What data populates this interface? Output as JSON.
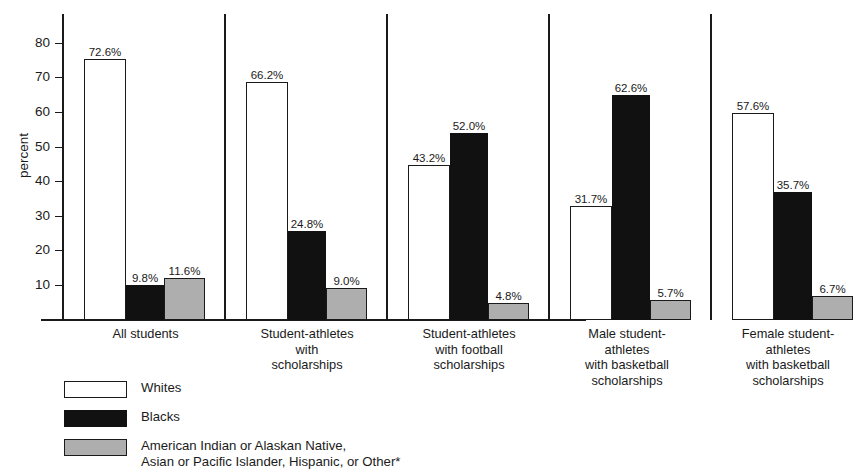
{
  "chart_data": {
    "type": "bar",
    "title": "",
    "subtitle": "",
    "xlabel": "",
    "ylabel": "percent",
    "ylim": [
      0,
      85
    ],
    "yticks": [
      10,
      20,
      30,
      40,
      50,
      60,
      70,
      80
    ],
    "grid": false,
    "legend_position": "bottom-left",
    "categories": [
      "All students",
      "Student-athletes\nwith\nscholarships",
      "Student-athletes\nwith football\nscholarships",
      "Male student-\nathletes\nwith basketball\nscholarships",
      "Female student-\nathletes\nwith basketball\nscholarships"
    ],
    "series": [
      {
        "name": "Whites",
        "color": "#ffffff",
        "values": [
          72.6,
          66.2,
          43.2,
          31.7,
          57.6
        ],
        "labels": [
          "72.6%",
          "66.2%",
          "43.2%",
          "31.7%",
          "57.6%"
        ]
      },
      {
        "name": "Blacks",
        "color": "#111111",
        "values": [
          9.8,
          24.8,
          52.0,
          62.6,
          35.7
        ],
        "labels": [
          "9.8%",
          "24.8%",
          "52.0%",
          "62.6%",
          "35.7%"
        ]
      },
      {
        "name": "American Indian or Alaskan Native,\nAsian or Pacific Islander, Hispanic, or Other*",
        "color": "#aeaeae",
        "values": [
          11.6,
          9.0,
          4.8,
          5.7,
          6.7
        ],
        "labels": [
          "11.6%",
          "9.0%",
          "4.8%",
          "5.7%",
          "6.7%"
        ]
      }
    ]
  },
  "axis": {
    "ylabel": "percent",
    "tick_10": "10",
    "tick_20": "20",
    "tick_30": "30",
    "tick_40": "40",
    "tick_50": "50",
    "tick_60": "60",
    "tick_70": "70",
    "tick_80": "80"
  },
  "categories": {
    "c0": "All students",
    "c1": "Student-athletes\nwith\nscholarships",
    "c2": "Student-athletes\nwith football\nscholarships",
    "c3": "Male student-\nathletes\nwith basketball\nscholarships",
    "c4": "Female student-\nathletes\nwith basketball\nscholarships"
  },
  "values": {
    "g0_whites": "72.6%",
    "g0_blacks": "9.8%",
    "g0_other": "11.6%",
    "g1_whites": "66.2%",
    "g1_blacks": "24.8%",
    "g1_other": "9.0%",
    "g2_whites": "43.2%",
    "g2_blacks": "52.0%",
    "g2_other": "4.8%",
    "g3_whites": "31.7%",
    "g3_blacks": "62.6%",
    "g3_other": "5.7%",
    "g4_whites": "57.6%",
    "g4_blacks": "35.7%",
    "g4_other": "6.7%"
  },
  "legend": {
    "whites": "Whites",
    "blacks": "Blacks",
    "other": "American Indian or Alaskan Native,\nAsian or Pacific Islander, Hispanic, or Other*"
  },
  "colors": {
    "whites": "#ffffff",
    "blacks": "#111111",
    "other": "#aeaeae",
    "axis": "#1a1a1a",
    "background": "#ffffff"
  }
}
